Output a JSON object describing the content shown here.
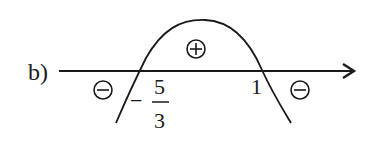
{
  "diagram": {
    "type": "sign-chart",
    "part_label": "b)",
    "axis": {
      "direction": "right-arrow"
    },
    "roots": [
      {
        "sign": "−",
        "numerator": "5",
        "denominator": "3",
        "display": "−5/3"
      },
      {
        "display": "1"
      }
    ],
    "curve": "downward parabola",
    "regions": [
      {
        "position": "left of −5/3",
        "sign": "minus",
        "symbol": "⊖"
      },
      {
        "position": "between −5/3 and 1",
        "sign": "plus",
        "symbol": "⊕"
      },
      {
        "position": "right of 1",
        "sign": "minus",
        "symbol": "⊖"
      }
    ],
    "colors": {
      "ink": "#1a1a1a",
      "background": "#ffffff"
    }
  }
}
